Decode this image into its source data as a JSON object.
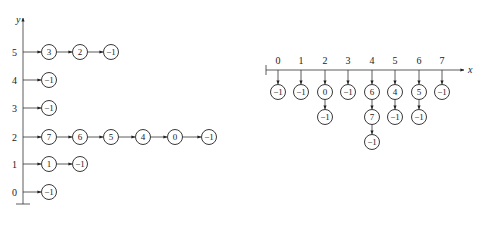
{
  "left_graph": {
    "axis_label": "y",
    "rows": [
      {
        "label": "5",
        "nodes": [
          "3",
          "2",
          "-1"
        ]
      },
      {
        "label": "4",
        "nodes": [
          "-1"
        ]
      },
      {
        "label": "3",
        "nodes": [
          "-1"
        ]
      },
      {
        "label": "2",
        "nodes": [
          "7",
          "6",
          "5",
          "4",
          "0",
          "-1"
        ]
      },
      {
        "label": "1",
        "nodes": [
          "1",
          "-1"
        ]
      },
      {
        "label": "0",
        "nodes": [
          "-1"
        ]
      }
    ]
  },
  "right_graph": {
    "axis_label": "x",
    "columns": [
      {
        "label": "0",
        "nodes": [
          "-1"
        ]
      },
      {
        "label": "1",
        "nodes": [
          "-1"
        ]
      },
      {
        "label": "2",
        "nodes": [
          "0",
          "-1"
        ]
      },
      {
        "label": "3",
        "nodes": [
          "-1"
        ]
      },
      {
        "label": "4",
        "nodes": [
          "6",
          "7",
          "-1"
        ]
      },
      {
        "label": "5",
        "nodes": [
          "4",
          "-1"
        ]
      },
      {
        "label": "6",
        "nodes": [
          "5",
          "-1"
        ]
      },
      {
        "label": "7",
        "nodes": [
          "-1"
        ]
      }
    ]
  }
}
